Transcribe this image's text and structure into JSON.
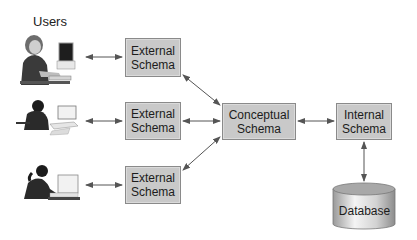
{
  "diagram": {
    "users_label": "Users",
    "users": [
      {
        "name": "user-1",
        "icon": "person-at-computer-icon"
      },
      {
        "name": "user-2",
        "icon": "person-on-phone-at-computer-icon"
      },
      {
        "name": "user-3",
        "icon": "person-typing-at-computer-icon"
      }
    ],
    "external_schemas": [
      {
        "line1": "External",
        "line2": "Schema"
      },
      {
        "line1": "External",
        "line2": "Schema"
      },
      {
        "line1": "External",
        "line2": "Schema"
      }
    ],
    "conceptual_schema": {
      "line1": "Conceptual",
      "line2": "Schema"
    },
    "internal_schema": {
      "line1": "Internal",
      "line2": "Schema"
    },
    "database": {
      "label": "Database",
      "icon": "database-cylinder-icon"
    },
    "colors": {
      "box_fill": "#c9c9c9",
      "box_border": "#8a8a8a",
      "arrow": "#555555",
      "text": "#1c1c1c"
    }
  }
}
